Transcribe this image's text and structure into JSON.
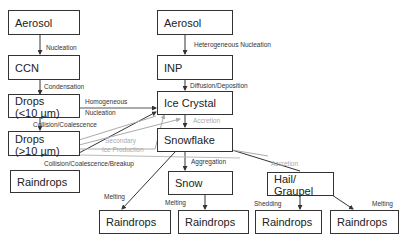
{
  "diagram": {
    "nodes": {
      "aerosol_left": "Aerosol",
      "ccn": "CCN",
      "drops_small_1": "Drops",
      "drops_small_2": "(<10 µm)",
      "drops_large_1": "Drops",
      "drops_large_2": "(>10 µm)",
      "raindrops_left": "Raindrops",
      "aerosol_center": "Aerosol",
      "inp": "INP",
      "ice_crystal": "Ice Crystal",
      "snowflake": "Snowflake",
      "snow": "Snow",
      "hail_1": "Hail/",
      "hail_2": "Graupel",
      "raindrops_1": "Raindrops",
      "raindrops_2": "Raindrops",
      "raindrops_3": "Raindrops",
      "raindrops_4": "Raindrops"
    },
    "edges": {
      "nucleation": "Nucleation",
      "condensation": "Condensation",
      "homogeneous_1": "Homogeneous",
      "homogeneous_2": "Nucleation",
      "collision_coalescence": "Collision/Coalescence",
      "collision_breakup": "Collision/Coalescence/Breakup",
      "secondary_1": "Secondary",
      "secondary_2": "Ice Production",
      "heterogeneous": "Heterogeneous Nucleation",
      "diffusion": "Diffusion/Deposition",
      "accretion_1": "Accretion",
      "aggregation": "Aggregation",
      "accretion_2": "Accretion",
      "melting_1": "Melting",
      "melting_2": "Melting",
      "shedding": "Shedding",
      "melting_3": "Melting"
    }
  }
}
